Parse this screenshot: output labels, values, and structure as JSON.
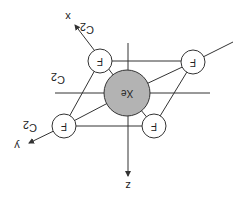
{
  "diagram": {
    "title": "",
    "molecule": "XeF4",
    "rotation_deg": 180,
    "colors": {
      "line": "#333333",
      "central_atom_fill": "#b3b3b3",
      "ligand_fill": "#ffffff",
      "background": "#ffffff"
    },
    "central_atom": {
      "label": "Xe",
      "cx": 127,
      "cy": 93,
      "r": 23
    },
    "ligands": [
      {
        "label": "F",
        "cx": 100,
        "cy": 61,
        "r": 12
      },
      {
        "label": "F",
        "cx": 193,
        "cy": 62,
        "r": 12
      },
      {
        "label": "F",
        "cx": 64,
        "cy": 126,
        "r": 12
      },
      {
        "label": "F",
        "cx": 154,
        "cy": 126,
        "r": 12
      }
    ],
    "axes": [
      {
        "label": "x",
        "x": 68,
        "y": 17
      },
      {
        "label": "y",
        "x": 17,
        "y": 146
      },
      {
        "label": "z",
        "x": 128,
        "y": 186
      }
    ],
    "symmetry_labels": [
      {
        "label": "C",
        "sub": "2",
        "x": 87,
        "y": 30
      },
      {
        "label": "C",
        "sub": "2",
        "x": 58,
        "y": 80
      },
      {
        "label": "C",
        "sub": "2",
        "x": 30,
        "y": 128
      }
    ]
  }
}
